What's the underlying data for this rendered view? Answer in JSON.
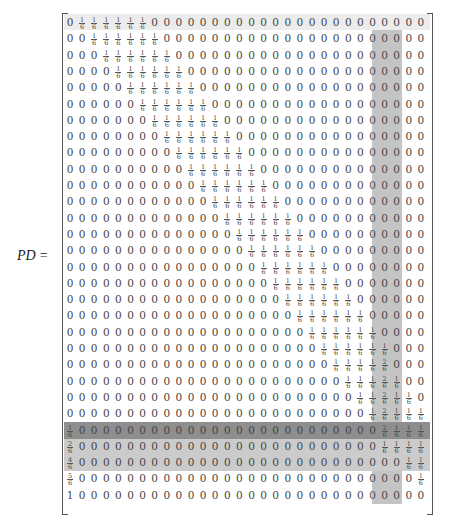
{
  "equation": {
    "lhs": "PD",
    "equals": "="
  },
  "highlights": {
    "row_bands": [
      {
        "row": 0,
        "color": "#ececec"
      },
      {
        "row": 25,
        "color": "#8e8e8e"
      },
      {
        "rows": [
          26,
          27
        ],
        "color": "#cbcbcb"
      }
    ],
    "column_band": {
      "columns": [
        26,
        27
      ],
      "from_row": 1,
      "to_row": 29,
      "color": "#c4c4c4"
    }
  },
  "matrix": {
    "size": [
      30,
      30
    ],
    "rows": [
      [
        "0",
        "1/6",
        "1/6",
        "1/6",
        "1/6",
        "1/6",
        "1/6",
        "0",
        "0",
        "0",
        "0",
        "0",
        "0",
        "0",
        "0",
        "0",
        "0",
        "0",
        "0",
        "0",
        "0",
        "0",
        "0",
        "0",
        "0",
        "0",
        "0",
        "0",
        "0",
        "0"
      ],
      [
        "0",
        "0",
        "1/6",
        "1/6",
        "1/6",
        "1/6",
        "1/6",
        "1/6",
        "0",
        "0",
        "0",
        "0",
        "0",
        "0",
        "0",
        "0",
        "0",
        "0",
        "0",
        "0",
        "0",
        "0",
        "0",
        "0",
        "0",
        "0",
        "0",
        "0",
        "0",
        "0"
      ],
      [
        "0",
        "0",
        "0",
        "1/6",
        "1/6",
        "1/6",
        "1/6",
        "1/6",
        "1/6",
        "0",
        "0",
        "0",
        "0",
        "0",
        "0",
        "0",
        "0",
        "0",
        "0",
        "0",
        "0",
        "0",
        "0",
        "0",
        "0",
        "0",
        "0",
        "0",
        "0",
        "0"
      ],
      [
        "0",
        "0",
        "0",
        "0",
        "1/6",
        "1/6",
        "1/6",
        "1/6",
        "1/6",
        "1/6",
        "0",
        "0",
        "0",
        "0",
        "0",
        "0",
        "0",
        "0",
        "0",
        "0",
        "0",
        "0",
        "0",
        "0",
        "0",
        "0",
        "0",
        "0",
        "0",
        "0"
      ],
      [
        "0",
        "0",
        "0",
        "0",
        "0",
        "1/6",
        "1/6",
        "1/6",
        "1/6",
        "1/6",
        "1/6",
        "0",
        "0",
        "0",
        "0",
        "0",
        "0",
        "0",
        "0",
        "0",
        "0",
        "0",
        "0",
        "0",
        "0",
        "0",
        "0",
        "0",
        "0",
        "0"
      ],
      [
        "0",
        "0",
        "0",
        "0",
        "0",
        "0",
        "1/6",
        "1/6",
        "1/6",
        "1/6",
        "1/6",
        "1/6",
        "0",
        "0",
        "0",
        "0",
        "0",
        "0",
        "0",
        "0",
        "0",
        "0",
        "0",
        "0",
        "0",
        "0",
        "0",
        "0",
        "0",
        "0"
      ],
      [
        "0",
        "0",
        "0",
        "0",
        "0",
        "0",
        "0",
        "1/6",
        "1/6",
        "1/6",
        "1/6",
        "1/6",
        "1/6",
        "0",
        "0",
        "0",
        "0",
        "0",
        "0",
        "0",
        "0",
        "0",
        "0",
        "0",
        "0",
        "0",
        "0",
        "0",
        "0",
        "0"
      ],
      [
        "0",
        "0",
        "0",
        "0",
        "0",
        "0",
        "0",
        "0",
        "1/6",
        "1/6",
        "1/6",
        "1/6",
        "1/6",
        "1/6",
        "0",
        "0",
        "0",
        "0",
        "0",
        "0",
        "0",
        "0",
        "0",
        "0",
        "0",
        "0",
        "0",
        "0",
        "0",
        "0"
      ],
      [
        "0",
        "0",
        "0",
        "0",
        "0",
        "0",
        "0",
        "0",
        "0",
        "1/6",
        "1/6",
        "1/6",
        "1/6",
        "1/6",
        "1/6",
        "0",
        "0",
        "0",
        "0",
        "0",
        "0",
        "0",
        "0",
        "0",
        "0",
        "0",
        "0",
        "0",
        "0",
        "0"
      ],
      [
        "0",
        "0",
        "0",
        "0",
        "0",
        "0",
        "0",
        "0",
        "0",
        "0",
        "1/6",
        "1/6",
        "1/6",
        "1/6",
        "1/6",
        "1/6",
        "0",
        "0",
        "0",
        "0",
        "0",
        "0",
        "0",
        "0",
        "0",
        "0",
        "0",
        "0",
        "0",
        "0"
      ],
      [
        "0",
        "0",
        "0",
        "0",
        "0",
        "0",
        "0",
        "0",
        "0",
        "0",
        "0",
        "1/6",
        "1/6",
        "1/6",
        "1/6",
        "1/6",
        "1/6",
        "0",
        "0",
        "0",
        "0",
        "0",
        "0",
        "0",
        "0",
        "0",
        "0",
        "0",
        "0",
        "0"
      ],
      [
        "0",
        "0",
        "0",
        "0",
        "0",
        "0",
        "0",
        "0",
        "0",
        "0",
        "0",
        "0",
        "1/6",
        "1/6",
        "1/6",
        "1/6",
        "1/6",
        "1/6",
        "0",
        "0",
        "0",
        "0",
        "0",
        "0",
        "0",
        "0",
        "0",
        "0",
        "0",
        "0"
      ],
      [
        "0",
        "0",
        "0",
        "0",
        "0",
        "0",
        "0",
        "0",
        "0",
        "0",
        "0",
        "0",
        "0",
        "1/6",
        "1/6",
        "1/6",
        "1/6",
        "1/6",
        "1/6",
        "0",
        "0",
        "0",
        "0",
        "0",
        "0",
        "0",
        "0",
        "0",
        "0",
        "0"
      ],
      [
        "0",
        "0",
        "0",
        "0",
        "0",
        "0",
        "0",
        "0",
        "0",
        "0",
        "0",
        "0",
        "0",
        "0",
        "1/6",
        "1/6",
        "1/6",
        "1/6",
        "1/6",
        "1/6",
        "0",
        "0",
        "0",
        "0",
        "0",
        "0",
        "0",
        "0",
        "0",
        "0"
      ],
      [
        "0",
        "0",
        "0",
        "0",
        "0",
        "0",
        "0",
        "0",
        "0",
        "0",
        "0",
        "0",
        "0",
        "0",
        "0",
        "1/6",
        "1/6",
        "1/6",
        "1/6",
        "1/6",
        "1/6",
        "0",
        "0",
        "0",
        "0",
        "0",
        "0",
        "0",
        "0",
        "0"
      ],
      [
        "0",
        "0",
        "0",
        "0",
        "0",
        "0",
        "0",
        "0",
        "0",
        "0",
        "0",
        "0",
        "0",
        "0",
        "0",
        "0",
        "1/6",
        "1/6",
        "1/6",
        "1/6",
        "1/6",
        "1/6",
        "0",
        "0",
        "0",
        "0",
        "0",
        "0",
        "0",
        "0"
      ],
      [
        "0",
        "0",
        "0",
        "0",
        "0",
        "0",
        "0",
        "0",
        "0",
        "0",
        "0",
        "0",
        "0",
        "0",
        "0",
        "0",
        "0",
        "1/6",
        "1/6",
        "1/6",
        "1/6",
        "1/6",
        "1/6",
        "0",
        "0",
        "0",
        "0",
        "0",
        "0",
        "0"
      ],
      [
        "0",
        "0",
        "0",
        "0",
        "0",
        "0",
        "0",
        "0",
        "0",
        "0",
        "0",
        "0",
        "0",
        "0",
        "0",
        "0",
        "0",
        "0",
        "1/6",
        "1/6",
        "1/6",
        "1/6",
        "1/6",
        "1/6",
        "0",
        "0",
        "0",
        "0",
        "0",
        "0"
      ],
      [
        "0",
        "0",
        "0",
        "0",
        "0",
        "0",
        "0",
        "0",
        "0",
        "0",
        "0",
        "0",
        "0",
        "0",
        "0",
        "0",
        "0",
        "0",
        "0",
        "1/6",
        "1/6",
        "1/6",
        "1/6",
        "1/6",
        "1/6",
        "0",
        "0",
        "0",
        "0",
        "0"
      ],
      [
        "0",
        "0",
        "0",
        "0",
        "0",
        "0",
        "0",
        "0",
        "0",
        "0",
        "0",
        "0",
        "0",
        "0",
        "0",
        "0",
        "0",
        "0",
        "0",
        "0",
        "1/6",
        "1/6",
        "1/6",
        "1/6",
        "1/6",
        "1/6",
        "0",
        "0",
        "0",
        "0"
      ],
      [
        "0",
        "0",
        "0",
        "0",
        "0",
        "0",
        "0",
        "0",
        "0",
        "0",
        "0",
        "0",
        "0",
        "0",
        "0",
        "0",
        "0",
        "0",
        "0",
        "0",
        "0",
        "1/6",
        "1/6",
        "1/6",
        "1/6",
        "1/6",
        "1/6",
        "0",
        "0",
        "0"
      ],
      [
        "0",
        "0",
        "0",
        "0",
        "0",
        "0",
        "0",
        "0",
        "0",
        "0",
        "0",
        "0",
        "0",
        "0",
        "0",
        "0",
        "0",
        "0",
        "0",
        "0",
        "0",
        "0",
        "1/6",
        "1/6",
        "1/6",
        "1/6",
        "2/6",
        "0",
        "0",
        "0"
      ],
      [
        "0",
        "0",
        "0",
        "0",
        "0",
        "0",
        "0",
        "0",
        "0",
        "0",
        "0",
        "0",
        "0",
        "0",
        "0",
        "0",
        "0",
        "0",
        "0",
        "0",
        "0",
        "0",
        "0",
        "1/6",
        "1/6",
        "1/6",
        "2/6",
        "1/6",
        "0",
        "0"
      ],
      [
        "0",
        "0",
        "0",
        "0",
        "0",
        "0",
        "0",
        "0",
        "0",
        "0",
        "0",
        "0",
        "0",
        "0",
        "0",
        "0",
        "0",
        "0",
        "0",
        "0",
        "0",
        "0",
        "0",
        "0",
        "1/6",
        "1/6",
        "2/6",
        "1/6",
        "1/6",
        "0"
      ],
      [
        "0",
        "0",
        "0",
        "0",
        "0",
        "0",
        "0",
        "0",
        "0",
        "0",
        "0",
        "0",
        "0",
        "0",
        "0",
        "0",
        "0",
        "0",
        "0",
        "0",
        "0",
        "0",
        "0",
        "0",
        "0",
        "1/6",
        "2/6",
        "1/6",
        "1/6",
        "1/6"
      ],
      [
        "1/6",
        "0",
        "0",
        "0",
        "0",
        "0",
        "0",
        "0",
        "0",
        "0",
        "0",
        "0",
        "0",
        "0",
        "0",
        "0",
        "0",
        "0",
        "0",
        "0",
        "0",
        "0",
        "0",
        "0",
        "0",
        "0",
        "2/6",
        "1/6",
        "1/6",
        "1/6"
      ],
      [
        "2/6",
        "0",
        "0",
        "0",
        "0",
        "0",
        "0",
        "0",
        "0",
        "0",
        "0",
        "0",
        "0",
        "0",
        "0",
        "0",
        "0",
        "0",
        "0",
        "0",
        "0",
        "0",
        "0",
        "0",
        "0",
        "0",
        "1/6",
        "1/6",
        "1/6",
        "1/6"
      ],
      [
        "4/6",
        "0",
        "0",
        "0",
        "0",
        "0",
        "0",
        "0",
        "0",
        "0",
        "0",
        "0",
        "0",
        "0",
        "0",
        "0",
        "0",
        "0",
        "0",
        "0",
        "0",
        "0",
        "0",
        "0",
        "0",
        "0",
        "0",
        "0",
        "1/6",
        "1/6"
      ],
      [
        "5/6",
        "0",
        "0",
        "0",
        "0",
        "0",
        "0",
        "0",
        "0",
        "0",
        "0",
        "0",
        "0",
        "0",
        "0",
        "0",
        "0",
        "0",
        "0",
        "0",
        "0",
        "0",
        "0",
        "0",
        "0",
        "0",
        "0",
        "0",
        "0",
        "1/6"
      ],
      [
        "1",
        "0",
        "0",
        "0",
        "0",
        "0",
        "0",
        "0",
        "0",
        "0",
        "0",
        "0",
        "0",
        "0",
        "0",
        "0",
        "0",
        "0",
        "0",
        "0",
        "0",
        "0",
        "0",
        "0",
        "0",
        "0",
        "0",
        "0",
        "0",
        "0"
      ]
    ]
  }
}
